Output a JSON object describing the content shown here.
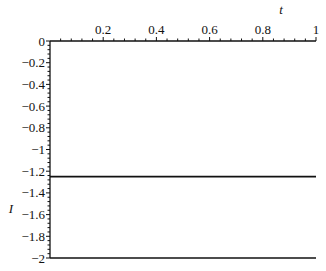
{
  "chart_data": {
    "type": "line",
    "title": "",
    "xlabel": "t",
    "ylabel": "I",
    "xlim": [
      0,
      1
    ],
    "ylim": [
      -2,
      0
    ],
    "x_axis_position": "top",
    "grid": false,
    "legend": null,
    "x_ticks": [
      0.2,
      0.4,
      0.6,
      0.8,
      1
    ],
    "x_tick_labels": [
      "0.2",
      "0.4",
      "0.6",
      "0.8",
      "1"
    ],
    "y_ticks": [
      0,
      -0.2,
      -0.4,
      -0.6,
      -0.8,
      -1,
      -1.2,
      -1.4,
      -1.6,
      -1.8,
      -2
    ],
    "y_tick_labels": [
      "0",
      "-0.2",
      "-0.4",
      "-0.6",
      "-0.8",
      "-1",
      "-1.2",
      "-1.4",
      "-1.6",
      "-1.8",
      "-2"
    ],
    "series": [
      {
        "name": "line-1",
        "x": [
          0,
          1
        ],
        "values": [
          -1.25,
          -1.25
        ],
        "color": "#111111"
      },
      {
        "name": "line-2",
        "x": [
          0,
          1
        ],
        "values": [
          -2,
          -2
        ],
        "color": "#111111"
      }
    ]
  }
}
